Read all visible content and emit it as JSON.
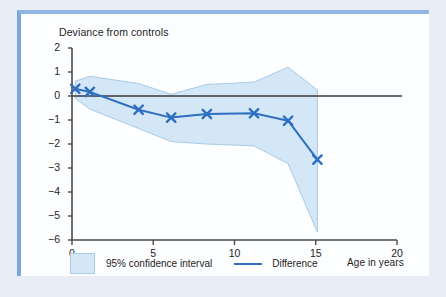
{
  "figure": {
    "y_axis_title": "Deviance from controls",
    "x_axis_title": "Age in years"
  },
  "legend": {
    "ci_label": "95% confidence interval",
    "difference_label": "Difference",
    "ci_color": "#d3e7f7",
    "ci_border_color": "#a8cbe8",
    "difference_color": "#2f6fc0"
  },
  "axes": {
    "y_ticks": [
      "2",
      "1",
      "0",
      "−1",
      "−2",
      "−3",
      "−4",
      "−5",
      "−6"
    ],
    "x_ticks": [
      "0",
      "5",
      "10",
      "15",
      "20"
    ]
  },
  "chart_data": {
    "type": "line",
    "title": "",
    "xlabel": "Age in years",
    "ylabel": "Deviance from controls",
    "xlim": [
      0,
      20
    ],
    "ylim": [
      -6,
      2
    ],
    "xticks": [
      0,
      5,
      10,
      15,
      20
    ],
    "yticks": [
      2,
      1,
      0,
      -1,
      -2,
      -3,
      -4,
      -5,
      -6
    ],
    "grid": false,
    "legend_position": "below-axis",
    "zero_reference_line": 0,
    "series": [
      {
        "name": "Difference",
        "type": "line",
        "color": "#2f6fc0",
        "marker": "x",
        "x": [
          0.2,
          1.1,
          4.1,
          6.1,
          8.3,
          11.2,
          13.3,
          15.1
        ],
        "values": [
          0.3,
          0.17,
          -0.57,
          -0.9,
          -0.75,
          -0.72,
          -1.03,
          -2.65
        ]
      },
      {
        "name": "95% confidence interval",
        "type": "band",
        "fill": "#d3e7f7",
        "edge": "#a8cbe8",
        "x": [
          0.2,
          1.1,
          4.1,
          6.1,
          8.3,
          11.2,
          13.3,
          15.1
        ],
        "upper": [
          0.62,
          0.82,
          0.52,
          0.07,
          0.48,
          0.58,
          1.2,
          0.25
        ],
        "lower": [
          -0.1,
          -0.55,
          -1.35,
          -1.9,
          -2.0,
          -2.08,
          -2.82,
          -5.68
        ]
      }
    ]
  }
}
